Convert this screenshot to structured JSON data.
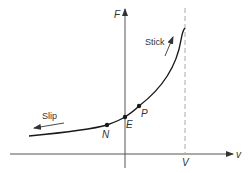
{
  "diagram": {
    "axes": {
      "y_label": "F",
      "x_label": "v",
      "vertical_asymptote_label": "V"
    },
    "points": [
      {
        "id": "N",
        "label": "N"
      },
      {
        "id": "E",
        "label": "E"
      },
      {
        "id": "P",
        "label": "P"
      }
    ],
    "annotations": {
      "stick": "Stick",
      "slip": "Slip"
    },
    "colors": {
      "line": "#1a1a1a",
      "axis": "#555555",
      "dashed": "#aaaaaa",
      "text": "#333333"
    }
  }
}
